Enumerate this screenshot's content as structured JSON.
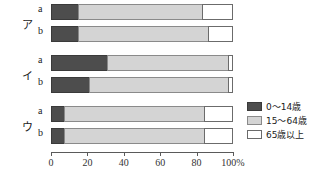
{
  "chart_data": {
    "type": "bar",
    "orientation": "horizontal",
    "stacked": true,
    "stack_mode": "percent",
    "title": "",
    "xlabel": "",
    "ylabel": "",
    "xlim": [
      0,
      100
    ],
    "xticks": [
      0,
      20,
      40,
      60,
      80,
      100
    ],
    "xticklabels": [
      "0",
      "20",
      "40",
      "60",
      "80",
      "100%"
    ],
    "grid": false,
    "legend_position": "right-bottom",
    "legend": [
      "0〜14歳",
      "15〜64歳",
      "65歳以上"
    ],
    "colors": [
      "#4d4d4d",
      "#d4d4d4",
      "#ffffff"
    ],
    "groups": [
      {
        "label": "ア",
        "rows": [
          {
            "label": "a",
            "values": [
              15,
              68,
              17
            ]
          },
          {
            "label": "b",
            "values": [
              15,
              71,
              14
            ]
          }
        ]
      },
      {
        "label": "イ",
        "rows": [
          {
            "label": "a",
            "values": [
              31,
              66,
              3
            ]
          },
          {
            "label": "b",
            "values": [
              21,
              76,
              3
            ]
          }
        ]
      },
      {
        "label": "ウ",
        "rows": [
          {
            "label": "a",
            "values": [
              7,
              77,
              16
            ]
          },
          {
            "label": "b",
            "values": [
              7,
              77,
              16
            ]
          }
        ]
      }
    ]
  }
}
